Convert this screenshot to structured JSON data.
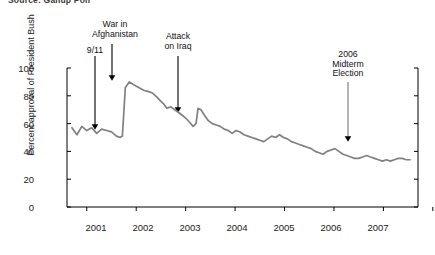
{
  "source": {
    "caption": "Source: Gallup Poll"
  },
  "axes": {
    "ylabel": "Percent approval of President Bush",
    "yticks": [
      "0",
      "20",
      "40",
      "60",
      "80",
      "100"
    ],
    "xticks": [
      "2001",
      "2002",
      "2003",
      "2004",
      "2005",
      "2006",
      "2007"
    ],
    "line_color": "#808080",
    "axis_color": "#000000"
  },
  "annotations": [
    {
      "id": "nine-eleven",
      "label": "9/11"
    },
    {
      "id": "afghanistan",
      "label": "War in\nAfghanistan"
    },
    {
      "id": "iraq",
      "label": "Attack\non Iraq"
    },
    {
      "id": "midterm",
      "label": "2006\nMidterm\nElection"
    }
  ],
  "chart_data": {
    "type": "line",
    "title": "",
    "subtitle": "",
    "xlabel": "",
    "ylabel": "Percent approval of President Bush",
    "ylim": [
      0,
      100
    ],
    "xlim": [
      2000.6,
      2007.7
    ],
    "grid": false,
    "legend": "none",
    "yticks": [
      0,
      20,
      40,
      60,
      80,
      100
    ],
    "xticks": [
      2001,
      2002,
      2003,
      2004,
      2005,
      2006,
      2007
    ],
    "series": [
      {
        "name": "Percent approval of President Bush",
        "color": "#808080",
        "x": [
          2000.7,
          2000.8,
          2000.9,
          2001.0,
          2001.1,
          2001.2,
          2001.3,
          2001.4,
          2001.5,
          2001.6,
          2001.67,
          2001.72,
          2001.78,
          2001.86,
          2001.95,
          2002.05,
          2002.15,
          2002.25,
          2002.33,
          2002.42,
          2002.5,
          2002.56,
          2002.62,
          2002.7,
          2002.78,
          2002.86,
          2002.93,
          2003.0,
          2003.08,
          2003.15,
          2003.21,
          2003.25,
          2003.31,
          2003.38,
          2003.46,
          2003.54,
          2003.62,
          2003.7,
          2003.78,
          2003.86,
          2003.94,
          2004.02,
          2004.1,
          2004.18,
          2004.26,
          2004.34,
          2004.42,
          2004.5,
          2004.58,
          2004.66,
          2004.74,
          2004.82,
          2004.9,
          2004.98,
          2005.06,
          2005.14,
          2005.22,
          2005.3,
          2005.38,
          2005.46,
          2005.54,
          2005.62,
          2005.7,
          2005.78,
          2005.86,
          2005.94,
          2006.02,
          2006.1,
          2006.18,
          2006.26,
          2006.34,
          2006.42,
          2006.5,
          2006.58,
          2006.66,
          2006.74,
          2006.82,
          2006.9,
          2006.98,
          2007.06,
          2007.14,
          2007.22,
          2007.3,
          2007.38,
          2007.46,
          2007.54
        ],
        "y": [
          57,
          52,
          58,
          55,
          57,
          53,
          56,
          55,
          54,
          51,
          50,
          51,
          86,
          90,
          88,
          86,
          84,
          83,
          82,
          79,
          76,
          74,
          71,
          72,
          70,
          68,
          66,
          64,
          61,
          58,
          60,
          71,
          70,
          66,
          62,
          60,
          59,
          58,
          56,
          55,
          53,
          55,
          54,
          52,
          51,
          50,
          49,
          48,
          47,
          49,
          51,
          50,
          52,
          50,
          49,
          47,
          46,
          45,
          44,
          43,
          42,
          40,
          39,
          38,
          40,
          41,
          42,
          40,
          38,
          37,
          36,
          35,
          35,
          36,
          37,
          36,
          35,
          34,
          33,
          34,
          33,
          34,
          35,
          35,
          34,
          34
        ]
      }
    ],
    "annotations": [
      {
        "label": "9/11",
        "x": 2001.71,
        "y_text": 100,
        "arrow_to_y": 62
      },
      {
        "label": "War in Afghanistan",
        "x": 2001.98,
        "y_text": 100,
        "arrow_to_y": 97
      },
      {
        "label": "Attack on Iraq",
        "x": 2003.25,
        "y_text": 100,
        "arrow_to_y": 75
      },
      {
        "label": "2006 Midterm Election",
        "x": 2006.7,
        "y_text": 100,
        "arrow_to_y": 53
      }
    ]
  }
}
